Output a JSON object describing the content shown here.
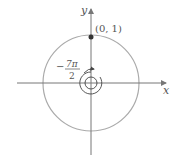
{
  "diagram": {
    "x_label": "x",
    "y_label": "y",
    "point_label": "(0, 1)",
    "angle_numerator": "7π",
    "angle_denominator": "2",
    "angle_sign": "−",
    "colors": {
      "circle": "#aaaaaa",
      "axes": "#777777",
      "point": "#333333"
    }
  }
}
